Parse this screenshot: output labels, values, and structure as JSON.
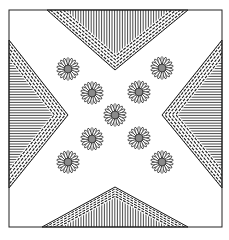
{
  "artwork": {
    "kind": "decorative-pattern",
    "description": "Square line-art pattern: four hatched chevron wedges pointing to center, nine daisies in an X arrangement",
    "canvas": {
      "width": 229,
      "height": 240,
      "background": "#ffffff"
    },
    "frame": {
      "x": 9,
      "y": 10,
      "width": 213,
      "height": 217,
      "stroke": "#222222"
    },
    "colors": {
      "line": "#1a1a1a",
      "flower_center": "#8a8a8a",
      "petal_fill": "#ffffff"
    },
    "wedges": [
      {
        "name": "top",
        "apex": [
          115,
          70
        ],
        "base_start": [
          47,
          10
        ],
        "base_end": [
          188,
          10
        ],
        "hatch": "vertical"
      },
      {
        "name": "bottom",
        "apex": [
          115,
          187
        ],
        "base_start": [
          42,
          227
        ],
        "base_end": [
          188,
          227
        ],
        "hatch": "vertical"
      },
      {
        "name": "left",
        "apex": [
          68,
          115
        ],
        "base_start": [
          9,
          40
        ],
        "base_end": [
          9,
          188
        ],
        "hatch": "horizontal"
      },
      {
        "name": "right",
        "apex": [
          162,
          115
        ],
        "base_start": [
          222,
          40
        ],
        "base_end": [
          222,
          188
        ],
        "hatch": "horizontal"
      }
    ],
    "flowers": [
      {
        "cx": 68,
        "cy": 69,
        "r": 11
      },
      {
        "cx": 162,
        "cy": 68,
        "r": 11
      },
      {
        "cx": 92,
        "cy": 93,
        "r": 11
      },
      {
        "cx": 139,
        "cy": 92,
        "r": 11
      },
      {
        "cx": 115,
        "cy": 115,
        "r": 11
      },
      {
        "cx": 92,
        "cy": 139,
        "r": 11
      },
      {
        "cx": 139,
        "cy": 138,
        "r": 11
      },
      {
        "cx": 68,
        "cy": 162,
        "r": 11
      },
      {
        "cx": 162,
        "cy": 162,
        "r": 11
      }
    ],
    "petals_per_flower": 18
  }
}
